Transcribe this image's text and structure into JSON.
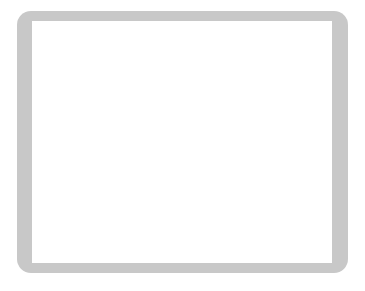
{
  "app": {
    "title": "Go Board Position",
    "board_size": 19,
    "background_color": "#ffffff",
    "frame_color": "#c8c8c8",
    "board_color": "#ffffff",
    "line_color": "#555555",
    "edge_color": "#000000",
    "black_stone_color": "#111111",
    "white_stone_color": "#ffffff",
    "white_stone_border": "#444444"
  },
  "geometry": {
    "frame": {
      "x": 17,
      "y": 11,
      "w": 331,
      "h": 262,
      "radius": 14
    },
    "board": {
      "x": 32,
      "y": 21,
      "w": 300,
      "h": 242
    },
    "origin_x": 32,
    "origin_y": 22,
    "step_x": 24.4,
    "step_y": 24.2,
    "cols": 13,
    "rows": 11,
    "stone_radius": 12.2
  },
  "star_points": [
    {
      "col": 3,
      "row": 1,
      "label": "star-top-left"
    },
    {
      "col": 9,
      "row": 1,
      "label": "star-top-right"
    },
    {
      "col": 9,
      "row": 7,
      "label": "star-lower-right"
    }
  ],
  "stones": [
    {
      "col": 1,
      "row": 2,
      "color": "black"
    },
    {
      "col": 2,
      "row": 2,
      "color": "black"
    },
    {
      "col": 3,
      "row": 2,
      "color": "black"
    },
    {
      "col": 1,
      "row": 3,
      "color": "black"
    },
    {
      "col": 2,
      "row": 3,
      "color": "white"
    },
    {
      "col": 3,
      "row": 3,
      "color": "black"
    },
    {
      "col": 1,
      "row": 4,
      "color": "white"
    },
    {
      "col": 2,
      "row": 4,
      "color": "white"
    },
    {
      "col": 1,
      "row": 5,
      "color": "white"
    },
    {
      "col": 2,
      "row": 5,
      "color": "black"
    },
    {
      "col": 3,
      "row": 5,
      "color": "black"
    },
    {
      "col": 1,
      "row": 6,
      "color": "black"
    },
    {
      "col": 2,
      "row": 6,
      "color": "white"
    },
    {
      "col": 3,
      "row": 6,
      "color": "black"
    },
    {
      "col": 6,
      "row": 6,
      "color": "black"
    },
    {
      "col": 7,
      "row": 6,
      "color": "black"
    },
    {
      "col": 2,
      "row": 7,
      "color": "white"
    },
    {
      "col": 3,
      "row": 7,
      "color": "black"
    },
    {
      "col": 4,
      "row": 7,
      "color": "black"
    },
    {
      "col": 5,
      "row": 7,
      "color": "black"
    },
    {
      "col": 6,
      "row": 7,
      "color": "white"
    },
    {
      "col": 7,
      "row": 7,
      "color": "black"
    },
    {
      "col": 2,
      "row": 8,
      "color": "white"
    },
    {
      "col": 3,
      "row": 8,
      "color": "white"
    },
    {
      "col": 4,
      "row": 8,
      "color": "white"
    },
    {
      "col": 5,
      "row": 8,
      "color": "black"
    },
    {
      "col": 6,
      "row": 8,
      "color": "white"
    },
    {
      "col": 8,
      "row": 8,
      "color": "black"
    },
    {
      "col": 4,
      "row": 9,
      "color": "black"
    },
    {
      "col": 5,
      "row": 9,
      "color": "white"
    },
    {
      "col": 7,
      "row": 9,
      "color": "white"
    },
    {
      "col": 8,
      "row": 9,
      "color": "black"
    }
  ],
  "counts": {
    "black_stones": 19,
    "white_stones": 13,
    "total_stones": 32
  }
}
